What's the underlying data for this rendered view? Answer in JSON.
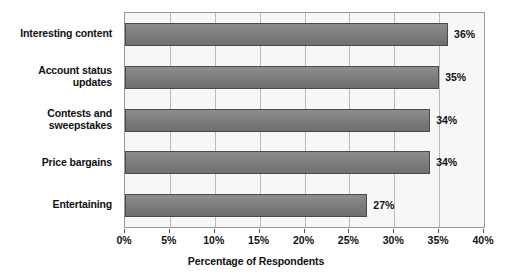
{
  "chart_data": {
    "type": "bar",
    "orientation": "horizontal",
    "title": "",
    "subtitle": "",
    "xlabel": "Percentage of Respondents",
    "ylabel": "",
    "xlim": [
      0,
      40
    ],
    "categories": [
      "Interesting content",
      "Account status updates",
      "Contests and sweepstakes",
      "Price bargains",
      "Entertaining"
    ],
    "category_lines": [
      [
        "Interesting content"
      ],
      [
        "Account status",
        "updates"
      ],
      [
        "Contests and",
        "sweepstakes"
      ],
      [
        "Price bargains"
      ],
      [
        "Entertaining"
      ]
    ],
    "values": [
      36,
      35,
      34,
      34,
      27
    ],
    "data_labels": [
      "36%",
      "35%",
      "34%",
      "34%",
      "27%"
    ],
    "xtick_values": [
      0,
      5,
      10,
      15,
      20,
      25,
      30,
      35,
      40
    ],
    "xtick_labels": [
      "0%",
      "5%",
      "10%",
      "15%",
      "20%",
      "25%",
      "30%",
      "35%",
      "40%"
    ],
    "grid": true,
    "grid_axis": "x",
    "legend": false,
    "legend_position": "none",
    "colors": {
      "bar_fill": "#7e7e7e",
      "bar_border": "#4a4a4a",
      "plot_background": "#f7f7f7",
      "plot_border": "#9a9a9a",
      "gridline": "#b9b9b9",
      "text": "#111111",
      "page_background": "#ffffff"
    }
  }
}
